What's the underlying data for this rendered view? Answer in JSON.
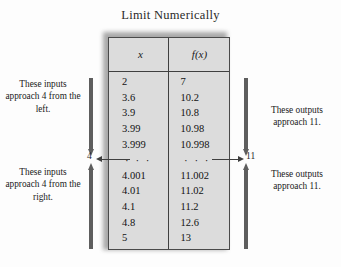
{
  "title": "Limit Numerically",
  "table": {
    "headers": [
      "x",
      "f(x)"
    ],
    "rows": [
      [
        "2",
        "7"
      ],
      [
        "3.6",
        "10.2"
      ],
      [
        "3.9",
        "10.8"
      ],
      [
        "3.99",
        "10.98"
      ],
      [
        "3.999",
        "10.998"
      ],
      [
        "· · ·",
        "· · ·"
      ],
      [
        "4.001",
        "11.002"
      ],
      [
        "4.01",
        "11.02"
      ],
      [
        "4.1",
        "11.2"
      ],
      [
        "4.8",
        "12.6"
      ],
      [
        "5",
        "13"
      ]
    ],
    "ellipsis_row_index": 5
  },
  "annotations": {
    "left_top": "These inputs approach 4 from the left.",
    "left_bottom": "These inputs approach 4 from the right.",
    "right_top": "These outputs approach 11.",
    "right_bottom": "These outputs approach 11."
  },
  "limits": {
    "input_limit": "4",
    "output_limit": "11"
  },
  "colors": {
    "background": "#fdfdfd",
    "table_fill": "#dcdcdc",
    "table_border": "#4a4a4a",
    "arrow": "#5e5e5e",
    "text": "#1a1a1a"
  },
  "chart_data": {
    "type": "table",
    "title": "Limit Numerically",
    "columns": [
      "x",
      "f(x)"
    ],
    "x": [
      2,
      3.6,
      3.9,
      3.99,
      3.999,
      null,
      4.001,
      4.01,
      4.1,
      4.8,
      5
    ],
    "y": [
      7,
      10.2,
      10.8,
      10.98,
      10.998,
      null,
      11.002,
      11.02,
      11.2,
      12.6,
      13
    ],
    "xlabel": "x",
    "ylabel": "f(x)",
    "annotations": [
      "These inputs approach 4 from the left.",
      "These inputs approach 4 from the right.",
      "These outputs approach 11.",
      "These outputs approach 11."
    ],
    "limit_point": 4,
    "limit_value": 11,
    "grid": false,
    "legend": "none"
  }
}
